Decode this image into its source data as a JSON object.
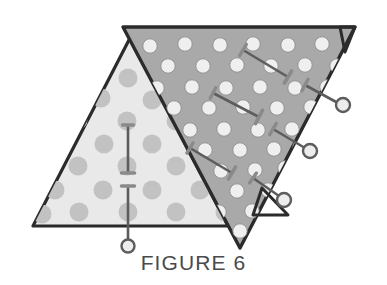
{
  "figure": {
    "caption": "FIGURE 6",
    "caption_color": "#4a4a4a",
    "background_color": "#ffffff"
  },
  "colors": {
    "light_panel_fill": "#e9e9e9",
    "light_panel_dot": "#c2c2c2",
    "dark_panel_fill": "#a9a9a9",
    "dark_panel_dot": "#efefef",
    "outline": "#2b2b2b",
    "pin_shaft": "#5d5d5d",
    "pin_head": "#8a8a8a",
    "pin_highlight": "#d8d8d8"
  },
  "shapes": {
    "light_triangle": {
      "name": "light-perforated-triangle",
      "points": "33,226 130,38 228,226",
      "fill": "#e9e9e9",
      "dot_fill": "#c2c2c2",
      "dot_radius": 9.5
    },
    "dark_triangle": {
      "name": "dark-perforated-triangle",
      "points": "123,27 355,27 240,248",
      "fill": "#a9a9a9",
      "dot_fill": "#efefef",
      "dot_radius": 7.2
    },
    "corner_flap_top_right": {
      "name": "corner-flap-top-right",
      "points": "340,27 355,27 345,52"
    },
    "corner_flap_bottom_right": {
      "name": "corner-flap-bottom-right",
      "points": "262,188 288,215 253,215"
    }
  },
  "light_triangle_dots": [
    {
      "cx": 128,
      "cy": 78
    },
    {
      "cx": 101,
      "cy": 98
    },
    {
      "cx": 152,
      "cy": 100
    },
    {
      "cx": 78,
      "cy": 120
    },
    {
      "cx": 127,
      "cy": 121
    },
    {
      "cx": 176,
      "cy": 121
    },
    {
      "cx": 56,
      "cy": 143
    },
    {
      "cx": 104,
      "cy": 144
    },
    {
      "cx": 152,
      "cy": 144
    },
    {
      "cx": 199,
      "cy": 144
    },
    {
      "cx": 78,
      "cy": 166
    },
    {
      "cx": 127,
      "cy": 166
    },
    {
      "cx": 176,
      "cy": 166
    },
    {
      "cx": 55,
      "cy": 190
    },
    {
      "cx": 103,
      "cy": 190
    },
    {
      "cx": 152,
      "cy": 190
    },
    {
      "cx": 200,
      "cy": 190
    },
    {
      "cx": 79,
      "cy": 212
    },
    {
      "cx": 128,
      "cy": 212
    },
    {
      "cx": 176,
      "cy": 212
    },
    {
      "cx": 225,
      "cy": 212
    },
    {
      "cx": 42,
      "cy": 214
    }
  ],
  "dark_triangle_dots": [
    {
      "cx": 150,
      "cy": 46
    },
    {
      "cx": 185,
      "cy": 44
    },
    {
      "cx": 220,
      "cy": 45
    },
    {
      "cx": 253,
      "cy": 44
    },
    {
      "cx": 288,
      "cy": 45
    },
    {
      "cx": 322,
      "cy": 44
    },
    {
      "cx": 168,
      "cy": 66
    },
    {
      "cx": 203,
      "cy": 66
    },
    {
      "cx": 237,
      "cy": 65
    },
    {
      "cx": 271,
      "cy": 66
    },
    {
      "cx": 305,
      "cy": 65
    },
    {
      "cx": 337,
      "cy": 66
    },
    {
      "cx": 157,
      "cy": 88
    },
    {
      "cx": 192,
      "cy": 87
    },
    {
      "cx": 226,
      "cy": 88
    },
    {
      "cx": 260,
      "cy": 87
    },
    {
      "cx": 295,
      "cy": 88
    },
    {
      "cx": 327,
      "cy": 87
    },
    {
      "cx": 174,
      "cy": 108
    },
    {
      "cx": 209,
      "cy": 108
    },
    {
      "cx": 243,
      "cy": 107
    },
    {
      "cx": 277,
      "cy": 108
    },
    {
      "cx": 311,
      "cy": 107
    },
    {
      "cx": 190,
      "cy": 130
    },
    {
      "cx": 224,
      "cy": 129
    },
    {
      "cx": 258,
      "cy": 130
    },
    {
      "cx": 292,
      "cy": 129
    },
    {
      "cx": 318,
      "cy": 126
    },
    {
      "cx": 205,
      "cy": 150
    },
    {
      "cx": 240,
      "cy": 150
    },
    {
      "cx": 274,
      "cy": 149
    },
    {
      "cx": 300,
      "cy": 147
    },
    {
      "cx": 221,
      "cy": 171
    },
    {
      "cx": 255,
      "cy": 170
    },
    {
      "cx": 285,
      "cy": 168
    },
    {
      "cx": 237,
      "cy": 191
    },
    {
      "cx": 268,
      "cy": 190
    },
    {
      "cx": 252,
      "cy": 211
    },
    {
      "cx": 219,
      "cy": 212
    },
    {
      "cx": 240,
      "cy": 231
    }
  ],
  "pins": [
    {
      "name": "pin-left-upper",
      "x1": 128,
      "y1": 125,
      "x2": 128,
      "y2": 173,
      "head": "flat-top",
      "head_size": 11,
      "tip": "flange",
      "tip_size": 13,
      "ring": false
    },
    {
      "name": "pin-left-lower",
      "x1": 128,
      "y1": 186,
      "x2": 128,
      "y2": 243,
      "head": "flat-top",
      "head_size": 13,
      "tip": "none",
      "tip_size": 0,
      "ring": true,
      "ring_cx": 128,
      "ring_cy": 246,
      "ring_r": 6.5
    },
    {
      "name": "pin-dark-upper-right",
      "x1": 243,
      "y1": 50,
      "x2": 288,
      "y2": 77,
      "head": "angled",
      "head_size": 13,
      "tip": "flange",
      "tip_size": 14,
      "ring": false
    },
    {
      "name": "pin-dark-center",
      "x1": 213,
      "y1": 93,
      "x2": 259,
      "y2": 117,
      "head": "angled",
      "head_size": 12,
      "tip": "flange",
      "tip_size": 15,
      "ring": false
    },
    {
      "name": "pin-dark-edge-upper",
      "x1": 305,
      "y1": 85,
      "x2": 338,
      "y2": 103,
      "head": "angled",
      "head_size": 13,
      "tip": "none",
      "tip_size": 0,
      "ring": true,
      "ring_cx": 343,
      "ring_cy": 105,
      "ring_r": 7
    },
    {
      "name": "pin-dark-edge-middle",
      "x1": 273,
      "y1": 129,
      "x2": 305,
      "y2": 148,
      "head": "angled",
      "head_size": 13,
      "tip": "none",
      "tip_size": 0,
      "ring": true,
      "ring_cx": 310,
      "ring_cy": 151,
      "ring_r": 7
    },
    {
      "name": "pin-dark-lower-left",
      "x1": 190,
      "y1": 148,
      "x2": 232,
      "y2": 173,
      "head": "angled",
      "head_size": 12,
      "tip": "flange",
      "tip_size": 14,
      "ring": false
    },
    {
      "name": "pin-dark-lower-right",
      "x1": 253,
      "y1": 178,
      "x2": 279,
      "y2": 196,
      "head": "angled",
      "head_size": 12,
      "tip": "none",
      "tip_size": 0,
      "ring": true,
      "ring_cx": 284,
      "ring_cy": 200,
      "ring_r": 7
    }
  ]
}
